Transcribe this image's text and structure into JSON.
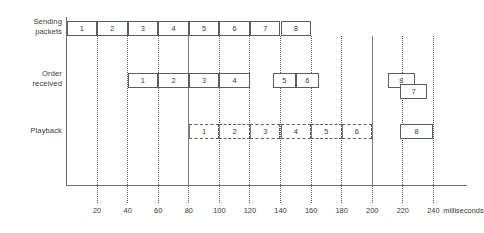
{
  "figure": {
    "type": "timing-diagram",
    "unit_label": "milliseconds",
    "time_axis": {
      "min": 0,
      "max": 240,
      "step": 20,
      "ticks": [
        20,
        40,
        60,
        80,
        100,
        120,
        140,
        160,
        180,
        200,
        220,
        240
      ],
      "gridline_style": "dotted",
      "solid_gridlines": [
        80,
        200
      ]
    },
    "rows": [
      {
        "id": "sending",
        "label_lines": [
          "Sending",
          "packets"
        ],
        "boxes": [
          {
            "text": "1",
            "start": 0,
            "end": 20,
            "style": "solid"
          },
          {
            "text": "2",
            "start": 20,
            "end": 40,
            "style": "solid"
          },
          {
            "text": "3",
            "start": 40,
            "end": 60,
            "style": "solid"
          },
          {
            "text": "4",
            "start": 60,
            "end": 80,
            "style": "solid"
          },
          {
            "text": "5",
            "start": 80,
            "end": 100,
            "style": "solid"
          },
          {
            "text": "6",
            "start": 100,
            "end": 120,
            "style": "solid"
          },
          {
            "text": "7",
            "start": 120,
            "end": 140,
            "style": "solid"
          },
          {
            "text": "8",
            "start": 140,
            "end": 160,
            "style": "solid"
          }
        ]
      },
      {
        "id": "order-received",
        "label_lines": [
          "Order",
          "received"
        ],
        "boxes": [
          {
            "text": "1",
            "start": 40,
            "end": 60,
            "style": "solid",
            "tier": 0
          },
          {
            "text": "2",
            "start": 60,
            "end": 80,
            "style": "solid",
            "tier": 0
          },
          {
            "text": "3",
            "start": 80,
            "end": 100,
            "style": "solid",
            "tier": 0
          },
          {
            "text": "4",
            "start": 100,
            "end": 120,
            "style": "solid",
            "tier": 0
          },
          {
            "text": "5",
            "start": 135,
            "end": 150,
            "style": "solid",
            "tier": 0
          },
          {
            "text": "6",
            "start": 150,
            "end": 165,
            "style": "solid",
            "tier": 0
          },
          {
            "text": "8",
            "start": 210,
            "end": 228,
            "style": "solid",
            "tier": 0
          },
          {
            "text": "7",
            "start": 218,
            "end": 236,
            "style": "solid",
            "tier": 1
          }
        ]
      },
      {
        "id": "playback",
        "label_lines": [
          "Playback"
        ],
        "boxes": [
          {
            "text": "1",
            "start": 80,
            "end": 100,
            "style": "dashed"
          },
          {
            "text": "2",
            "start": 100,
            "end": 120,
            "style": "dashed"
          },
          {
            "text": "3",
            "start": 120,
            "end": 140,
            "style": "dashed"
          },
          {
            "text": "4",
            "start": 140,
            "end": 160,
            "style": "dashed"
          },
          {
            "text": "5",
            "start": 160,
            "end": 180,
            "style": "dashed"
          },
          {
            "text": "6",
            "start": 180,
            "end": 200,
            "style": "dashed"
          },
          {
            "text": "8",
            "start": 218,
            "end": 240,
            "style": "solid"
          }
        ]
      }
    ]
  },
  "colors": {
    "line": "#5d5d5d",
    "axis": "#6f6f6f",
    "text": "#3a3a3a",
    "background": "#ffffff"
  }
}
